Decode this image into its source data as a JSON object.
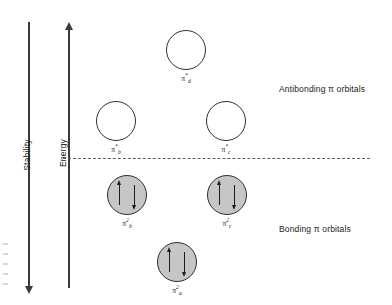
{
  "figure": {
    "type": "molecular-orbital-energy-diagram",
    "background": "#ffffff"
  },
  "axes": {
    "stability": {
      "label": "Stability",
      "direction": "downward-arrow"
    },
    "energy": {
      "label": "Energy",
      "direction": "upward-arrow"
    }
  },
  "levels": {
    "nonbonding_line_style": "dashed"
  },
  "captions": {
    "antibonding": "Antibonding π orbitals",
    "bonding": "Bonding π orbitals"
  },
  "orbitals": [
    {
      "id": "pi-d-star",
      "pi": "π",
      "superscript": "*",
      "subscript": "d",
      "fill": "empty",
      "electrons": 0,
      "region": "antibonding"
    },
    {
      "id": "pi-b-star",
      "pi": "π",
      "superscript": "*",
      "subscript": "b",
      "fill": "empty",
      "electrons": 0,
      "region": "antibonding"
    },
    {
      "id": "pi-c-star",
      "pi": "π",
      "superscript": "*",
      "subscript": "c",
      "fill": "empty",
      "electrons": 0,
      "region": "antibonding"
    },
    {
      "id": "pi-b-2",
      "pi": "π",
      "superscript": "2",
      "subscript": "b",
      "fill": "shaded",
      "electrons": 2,
      "region": "bonding"
    },
    {
      "id": "pi-c-2",
      "pi": "π",
      "superscript": "2",
      "subscript": "c",
      "fill": "shaded",
      "electrons": 2,
      "region": "bonding"
    },
    {
      "id": "pi-a-2",
      "pi": "π",
      "superscript": "2",
      "subscript": "a",
      "fill": "shaded",
      "electrons": 2,
      "region": "bonding"
    }
  ],
  "colors": {
    "orbital_fill_shaded": "#c6c6c6",
    "orbital_fill_empty": "#ffffff",
    "orbital_stroke": "#2e2e2e",
    "axis": "#3a3a3a",
    "dashed_line": "#5a5a5a",
    "text": "#1a1a1a"
  }
}
